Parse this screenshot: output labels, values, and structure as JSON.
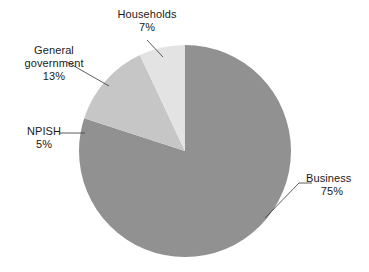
{
  "chart_data": {
    "type": "pie",
    "title": "",
    "categories": [
      "Business",
      "General government",
      "Households",
      "NPISH"
    ],
    "values": [
      75,
      13,
      7,
      5
    ],
    "value_suffix": "%",
    "start_angle_deg": 0,
    "direction": "clockwise",
    "legend_position": "none",
    "labels_outside": true,
    "leader_lines": true,
    "grid": false,
    "slices": [
      {
        "name": "Business",
        "value": 75,
        "label": "Business",
        "value_label": "75%",
        "color": "#919191",
        "start_deg": 0,
        "end_deg": 270
      },
      {
        "name": "NPISH",
        "value": 5,
        "label": "NPISH",
        "value_label": "5%",
        "color": "#919191",
        "start_deg": 270,
        "end_deg": 288
      },
      {
        "name": "General government",
        "value": 13,
        "label": "General government",
        "label_line1": "General",
        "label_line2": "government",
        "value_label": "13%",
        "color": "#c6c6c6",
        "start_deg": 288,
        "end_deg": 334.8
      },
      {
        "name": "Households",
        "value": 7,
        "label": "Households",
        "value_label": "7%",
        "color": "#e3e3e3",
        "start_deg": 334.8,
        "end_deg": 360
      }
    ]
  },
  "colors": {
    "background": "#ffffff",
    "text": "#1a1a1a",
    "leader_line": "#4a4a4a",
    "business": "#919191",
    "npish": "#919191",
    "general_government": "#c6c6c6",
    "households": "#e3e3e3"
  },
  "labels": {
    "households": {
      "name": "Households",
      "value": "7%"
    },
    "general_government": {
      "name_line1": "General",
      "name_line2": "government",
      "value": "13%"
    },
    "npish": {
      "name": "NPISH",
      "value": "5%"
    },
    "business": {
      "name": "Business",
      "value": "75%"
    }
  }
}
